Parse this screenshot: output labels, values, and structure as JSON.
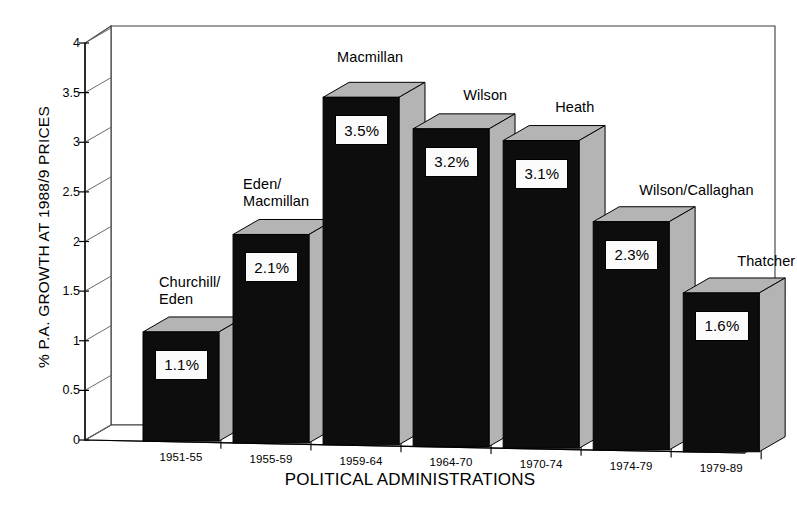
{
  "chart_data": {
    "type": "bar",
    "title": "",
    "xlabel": "POLITICAL ADMINISTRATIONS",
    "ylabel": "% P.A. GROWTH AT 1988/9 PRICES",
    "categories": [
      "1951-55",
      "1955-59",
      "1959-64",
      "1964-70",
      "1970-74",
      "1974-79",
      "1979-89"
    ],
    "values": [
      1.1,
      2.1,
      3.5,
      3.2,
      3.1,
      2.3,
      1.6
    ],
    "value_labels": [
      "1.1%",
      "2.1%",
      "3.5%",
      "3.2%",
      "3.1%",
      "2.3%",
      "1.6%"
    ],
    "point_labels": [
      "Churchill/\nEden",
      "Eden/\nMacmillan",
      "Macmillan",
      "Wilson",
      "Heath",
      "Wilson/Callaghan",
      "Thatcher"
    ],
    "ylim": [
      0,
      4
    ],
    "yticks": [
      0,
      0.5,
      1,
      1.5,
      2,
      2.5,
      3,
      3.5,
      4
    ],
    "ytick_labels": [
      "0",
      "0.5",
      "1",
      "1.5",
      "2",
      "2.5",
      "3",
      "3.5",
      "4"
    ],
    "grid": false,
    "legend": "none",
    "style": "3d-column",
    "colors": {
      "bar_front": "#0d0d0d",
      "bar_top": "#b4b4b4",
      "bar_side": "#b4b4b4",
      "axis": "#000000",
      "background": "#ffffff",
      "label_box": "#fbfbfb"
    }
  }
}
